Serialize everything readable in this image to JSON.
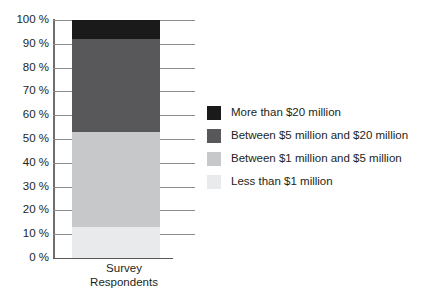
{
  "top_caption": "",
  "chart_data": {
    "type": "bar",
    "title": "",
    "subtitle": "",
    "stacked": true,
    "orientation": "vertical",
    "categories": [
      "Survey Respondents"
    ],
    "xlabel_lines": [
      "Survey",
      "Respondents"
    ],
    "ylabel": "",
    "ylim": [
      0,
      100
    ],
    "y_unit": "%",
    "grid": true,
    "legend_position": "right",
    "y_ticks": [
      {
        "value": 100,
        "label": "100 %"
      },
      {
        "value": 90,
        "label": "90 %"
      },
      {
        "value": 80,
        "label": "80 %"
      },
      {
        "value": 70,
        "label": "70 %"
      },
      {
        "value": 60,
        "label": "60 %"
      },
      {
        "value": 50,
        "label": "50 %"
      },
      {
        "value": 40,
        "label": "40 %"
      },
      {
        "value": 30,
        "label": "30 %"
      },
      {
        "value": 20,
        "label": "20 %"
      },
      {
        "value": 10,
        "label": "10 %"
      },
      {
        "value": 0,
        "label": "0 %"
      }
    ],
    "series": [
      {
        "name": "More than $20 million",
        "values": [
          8
        ],
        "color": "#1a1a1a",
        "cum_top": 100,
        "cum_bottom": 92
      },
      {
        "name": "Between $5 million and $20 million",
        "values": [
          39
        ],
        "color": "#58585a",
        "cum_top": 92,
        "cum_bottom": 53
      },
      {
        "name": "Between $1 million and $5 million",
        "values": [
          40
        ],
        "color": "#c7c8ca",
        "cum_top": 53,
        "cum_bottom": 13
      },
      {
        "name": "Less than $1 million",
        "values": [
          13
        ],
        "color": "#e9eaeb",
        "cum_top": 13,
        "cum_bottom": 0
      }
    ]
  },
  "legend": {
    "items": [
      {
        "label": "More than $20 million",
        "color": "#1a1a1a"
      },
      {
        "label": "Between $5 million and $20 million",
        "color": "#58585a"
      },
      {
        "label": "Between $1 million and $5 million",
        "color": "#c7c8ca"
      },
      {
        "label": "Less than $1 million",
        "color": "#e9eaeb"
      }
    ]
  },
  "colors": {
    "axis": "#6d6e71",
    "gridline": "#8c8c8c",
    "baseline": "#58595b",
    "text": "#231f20",
    "background": "#ffffff"
  }
}
